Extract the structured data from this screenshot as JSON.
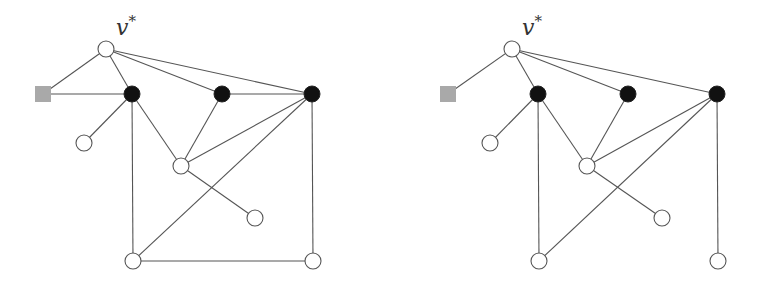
{
  "figure": {
    "panels": [
      {
        "id": "left",
        "label": "v",
        "label_sup": "*",
        "label_pos": [
          116,
          35
        ],
        "nodes": [
          {
            "id": "vstar",
            "type": "white",
            "x": 106,
            "y": 49
          },
          {
            "id": "sq",
            "type": "square",
            "x": 43,
            "y": 94
          },
          {
            "id": "b1",
            "type": "black",
            "x": 132,
            "y": 94
          },
          {
            "id": "b2",
            "type": "black",
            "x": 222,
            "y": 94
          },
          {
            "id": "b3",
            "type": "black",
            "x": 312,
            "y": 94
          },
          {
            "id": "w1",
            "type": "white",
            "x": 84,
            "y": 143
          },
          {
            "id": "w2",
            "type": "white",
            "x": 181,
            "y": 166
          },
          {
            "id": "w3",
            "type": "white",
            "x": 255,
            "y": 218
          },
          {
            "id": "w4",
            "type": "white",
            "x": 133,
            "y": 261
          },
          {
            "id": "w5",
            "type": "white",
            "x": 313,
            "y": 261
          }
        ],
        "edges": [
          [
            "vstar",
            "sq"
          ],
          [
            "vstar",
            "b1"
          ],
          [
            "vstar",
            "b2"
          ],
          [
            "vstar",
            "b3"
          ],
          [
            "sq",
            "b1"
          ],
          [
            "b1",
            "w1"
          ],
          [
            "b1",
            "w2"
          ],
          [
            "b1",
            "w4"
          ],
          [
            "b2",
            "b3"
          ],
          [
            "b2",
            "w2"
          ],
          [
            "b3",
            "w2"
          ],
          [
            "b3",
            "w4"
          ],
          [
            "b3",
            "w5"
          ],
          [
            "w2",
            "w3"
          ],
          [
            "w4",
            "w5"
          ]
        ]
      },
      {
        "id": "right",
        "label": "v",
        "label_sup": "*",
        "label_pos": [
          522,
          35
        ],
        "nodes": [
          {
            "id": "vstar",
            "type": "white",
            "x": 512,
            "y": 49
          },
          {
            "id": "sq",
            "type": "square",
            "x": 448,
            "y": 94
          },
          {
            "id": "b1",
            "type": "black",
            "x": 538,
            "y": 94
          },
          {
            "id": "b2",
            "type": "black",
            "x": 628,
            "y": 94
          },
          {
            "id": "b3",
            "type": "black",
            "x": 717,
            "y": 94
          },
          {
            "id": "w1",
            "type": "white",
            "x": 490,
            "y": 143
          },
          {
            "id": "w2",
            "type": "white",
            "x": 587,
            "y": 166
          },
          {
            "id": "w3",
            "type": "white",
            "x": 662,
            "y": 218
          },
          {
            "id": "w4",
            "type": "white",
            "x": 539,
            "y": 261
          },
          {
            "id": "w5",
            "type": "white",
            "x": 718,
            "y": 261
          }
        ],
        "edges": [
          [
            "vstar",
            "sq"
          ],
          [
            "vstar",
            "b1"
          ],
          [
            "vstar",
            "b2"
          ],
          [
            "vstar",
            "b3"
          ],
          [
            "b1",
            "w1"
          ],
          [
            "b1",
            "w2"
          ],
          [
            "b1",
            "w4"
          ],
          [
            "b2",
            "w2"
          ],
          [
            "b3",
            "w2"
          ],
          [
            "b3",
            "w4"
          ],
          [
            "b3",
            "w5"
          ],
          [
            "w2",
            "w3"
          ]
        ]
      }
    ],
    "style": {
      "node_radius": 8,
      "square_size": 16,
      "colors": {
        "edge": "#555555",
        "black_node": "#111111",
        "white_node": "#ffffff",
        "square_node": "#a9a9a9"
      }
    }
  }
}
